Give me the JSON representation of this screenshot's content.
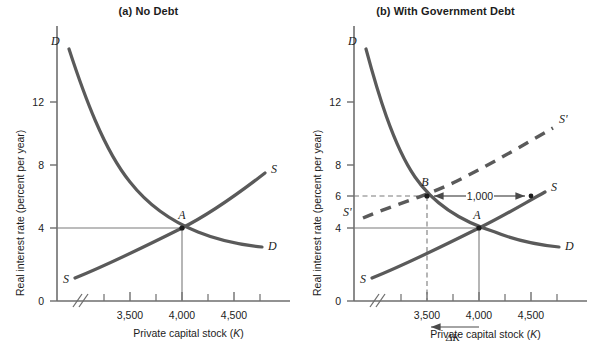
{
  "figure": {
    "axis_label_y": "Real interest rate (percent per year)",
    "axis_label_x": "Private capital stock (K)",
    "axis_label_x_main": "Private capital stock (",
    "axis_label_x_var": "K",
    "axis_label_x_close": ")",
    "colors": {
      "curve": "#5a5a5a",
      "axis": "#6e6e6e",
      "text": "#1c1c1c",
      "thin_line": "#7a7a7a",
      "background": "#ffffff"
    }
  },
  "panels": [
    {
      "id": "panel-a",
      "title": "(a) No Debt",
      "y_ticks": [
        {
          "value": 0,
          "label": "0"
        },
        {
          "value": 4,
          "label": "4"
        },
        {
          "value": 8,
          "label": "8"
        },
        {
          "value": 12,
          "label": "12"
        }
      ],
      "x_ticks": [
        {
          "value": 3500,
          "label": "3,500"
        },
        {
          "value": 4000,
          "label": "4,000"
        },
        {
          "value": 4500,
          "label": "4,500"
        }
      ],
      "x_minor_ticks": [
        3250,
        3750,
        4250,
        4750
      ],
      "axis_break": "//",
      "curve_labels": [
        {
          "name": "demand-top",
          "text": "D"
        },
        {
          "name": "demand-right",
          "text": "D"
        },
        {
          "name": "supply-left",
          "text": "S"
        },
        {
          "name": "supply-right",
          "text": "S"
        }
      ],
      "points": [
        {
          "name": "A",
          "label": "A",
          "x": 4000,
          "y": 4
        }
      ]
    },
    {
      "id": "panel-b",
      "title": "(b) With Government Debt",
      "y_ticks": [
        {
          "value": 0,
          "label": "0"
        },
        {
          "value": 4,
          "label": "4"
        },
        {
          "value": 6,
          "label": "6"
        },
        {
          "value": 8,
          "label": "8"
        },
        {
          "value": 12,
          "label": "12"
        }
      ],
      "x_ticks": [
        {
          "value": 3500,
          "label": "3,500"
        },
        {
          "value": 4000,
          "label": "4,000"
        },
        {
          "value": 4500,
          "label": "4,500"
        }
      ],
      "x_minor_ticks": [
        3250,
        3750,
        4250,
        4750
      ],
      "axis_break": "//",
      "curve_labels": [
        {
          "name": "demand-top",
          "text": "D"
        },
        {
          "name": "demand-right",
          "text": "D"
        },
        {
          "name": "supply-left",
          "text": "S"
        },
        {
          "name": "supply-right",
          "text": "S"
        },
        {
          "name": "supply-shift-left",
          "text": "S'"
        },
        {
          "name": "supply-shift-right",
          "text": "S'"
        }
      ],
      "points": [
        {
          "name": "A",
          "label": "A",
          "x": 4000,
          "y": 4
        },
        {
          "name": "B",
          "label": "B",
          "x": 3500,
          "y": 6
        }
      ],
      "annotations": [
        {
          "name": "crowding-gap",
          "text": "1,000",
          "from_x": 3500,
          "to_x": 4500,
          "at_y": 6
        },
        {
          "name": "delta-k",
          "text": "ΔK",
          "from_x": 4000,
          "to_x": 3500
        }
      ]
    }
  ],
  "chart_data": {
    "type": "line",
    "xlabel": "Private capital stock (K)",
    "ylabel": "Real interest rate (percent per year)",
    "xlim": [
      3150,
      4800
    ],
    "ylim": [
      0,
      14.5
    ],
    "grid": false,
    "legend": "inline-curve-labels",
    "panels": [
      {
        "name": "(a) No Debt",
        "series": [
          {
            "name": "D",
            "style": "solid",
            "points": [
              {
                "x": 3270,
                "y": 13.6
              },
              {
                "x": 3400,
                "y": 10.6
              },
              {
                "x": 3550,
                "y": 8.2
              },
              {
                "x": 3700,
                "y": 6.4
              },
              {
                "x": 3850,
                "y": 5.0
              },
              {
                "x": 4000,
                "y": 4.0
              },
              {
                "x": 4200,
                "y": 3.4
              },
              {
                "x": 4400,
                "y": 3.1
              },
              {
                "x": 4620,
                "y": 2.95
              }
            ]
          },
          {
            "name": "S",
            "style": "solid",
            "points": [
              {
                "x": 3330,
                "y": 1.5
              },
              {
                "x": 4000,
                "y": 4.0
              },
              {
                "x": 4620,
                "y": 7.0
              }
            ]
          }
        ],
        "markers": [
          {
            "label": "A",
            "x": 4000,
            "y": 4
          }
        ],
        "reference_lines": [
          {
            "from": {
              "x": 3150,
              "y": 4
            },
            "to": {
              "x": 4000,
              "y": 4
            },
            "style": "solid"
          },
          {
            "from": {
              "x": 4000,
              "y": 0
            },
            "to": {
              "x": 4000,
              "y": 4
            },
            "style": "solid"
          }
        ]
      },
      {
        "name": "(b) With Government Debt",
        "series": [
          {
            "name": "D",
            "style": "solid",
            "points": [
              {
                "x": 3270,
                "y": 13.6
              },
              {
                "x": 3400,
                "y": 10.6
              },
              {
                "x": 3500,
                "y": 6.0
              },
              {
                "x": 3700,
                "y": 6.4
              },
              {
                "x": 3850,
                "y": 5.0
              },
              {
                "x": 4000,
                "y": 4.0
              },
              {
                "x": 4200,
                "y": 3.4
              },
              {
                "x": 4400,
                "y": 3.1
              },
              {
                "x": 4620,
                "y": 2.95
              }
            ]
          },
          {
            "name": "S",
            "style": "solid",
            "points": [
              {
                "x": 3330,
                "y": 1.5
              },
              {
                "x": 4000,
                "y": 4.0
              },
              {
                "x": 4500,
                "y": 6.0
              },
              {
                "x": 4620,
                "y": 6.6
              }
            ]
          },
          {
            "name": "S'",
            "style": "dashed",
            "points": [
              {
                "x": 3260,
                "y": 4.6
              },
              {
                "x": 3500,
                "y": 6.0
              },
              {
                "x": 4000,
                "y": 8.3
              },
              {
                "x": 4560,
                "y": 10.9
              }
            ]
          }
        ],
        "markers": [
          {
            "label": "A",
            "x": 4000,
            "y": 4
          },
          {
            "label": "B",
            "x": 3500,
            "y": 6
          },
          {
            "label": "",
            "x": 4500,
            "y": 6
          }
        ],
        "reference_lines": [
          {
            "from": {
              "x": 3150,
              "y": 4
            },
            "to": {
              "x": 4000,
              "y": 4
            },
            "style": "solid"
          },
          {
            "from": {
              "x": 4000,
              "y": 0
            },
            "to": {
              "x": 4000,
              "y": 4
            },
            "style": "solid"
          },
          {
            "from": {
              "x": 3150,
              "y": 6
            },
            "to": {
              "x": 3500,
              "y": 6
            },
            "style": "dashed"
          },
          {
            "from": {
              "x": 3500,
              "y": 0
            },
            "to": {
              "x": 3500,
              "y": 6
            },
            "style": "dashed"
          }
        ],
        "annotations": [
          {
            "text": "1,000",
            "type": "double-arrow",
            "from_x": 3500,
            "to_x": 4500,
            "y": 6
          },
          {
            "text": "ΔK",
            "type": "left-arrow",
            "from_x": 4000,
            "to_x": 3500
          }
        ]
      }
    ]
  }
}
